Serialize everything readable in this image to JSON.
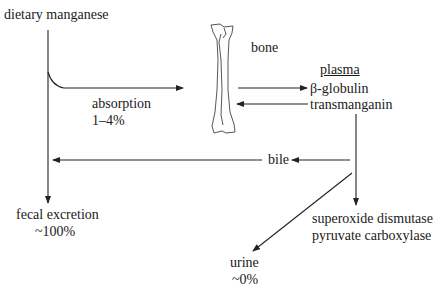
{
  "diagram": {
    "nodes": {
      "dietary": "dietary manganese",
      "absorption": "absorption",
      "absorption_pct": "1–4%",
      "bone": "bone",
      "plasma_header": "plasma",
      "plasma_1": "β-globulin",
      "plasma_2": "transmanganin",
      "bile": "bile",
      "fecal": "fecal excretion",
      "fecal_pct": "~100%",
      "enzyme_1": "superoxide dismutase",
      "enzyme_2": "pyruvate carboxylase",
      "urine": "urine",
      "urine_pct": "~0%"
    },
    "edges": [
      {
        "from": "dietary manganese",
        "to": "fecal excretion"
      },
      {
        "from": "dietary manganese",
        "to": "plasma",
        "label": "absorption 1–4%"
      },
      {
        "from": "bone",
        "to": "plasma"
      },
      {
        "from": "plasma",
        "to": "bone"
      },
      {
        "from": "plasma",
        "to": "fecal excretion",
        "label": "bile"
      },
      {
        "from": "plasma",
        "to": "superoxide dismutase / pyruvate carboxylase"
      },
      {
        "from": "plasma",
        "to": "urine"
      }
    ],
    "colors": {
      "line": "#222222",
      "text": "#1a1a1a",
      "background": "#ffffff"
    }
  }
}
